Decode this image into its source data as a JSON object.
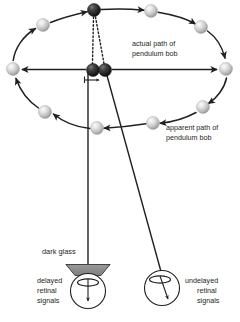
{
  "figure": {
    "background_color": "#ffffff",
    "line_color": "#231f20",
    "labels": {
      "actual_path_line1": "actual path of",
      "actual_path_line2": "pendulum bob",
      "apparent_path_line1": "apparent path of",
      "apparent_path_line2": "pendulum bob",
      "dark_glass": "dark glass",
      "delayed_line1": "delayed",
      "delayed_line2": "retinal",
      "delayed_line3": "signals",
      "undelayed_line1": "undelayed",
      "undelayed_line2": "retinal",
      "undelayed_line3": "signals"
    },
    "colors": {
      "stroke": "#231f20",
      "light_sphere_light": "#f2f2f2",
      "light_sphere_mid": "#c9c9c9",
      "light_sphere_dark": "#8c8c8c",
      "dark_sphere_light": "#6e6e6e",
      "dark_sphere_mid": "#2b2b2b",
      "dark_sphere_dark": "#111111",
      "glass_fill": "#8a8a8a",
      "glass_top_fill": "#b5b5b5"
    },
    "geometry": {
      "ellipse_center_x": 119,
      "ellipse_center_y": 69,
      "ellipse_radius_x": 107,
      "ellipse_radius_y": 59
    },
    "spheres": [
      {
        "name": "bob-top-actual",
        "cx": 94,
        "cy": 10,
        "r": 6.5,
        "shade": "dark"
      },
      {
        "name": "bob-upper-left",
        "cx": 43,
        "cy": 25,
        "r": 6.5,
        "shade": "light"
      },
      {
        "name": "bob-left",
        "cx": 13,
        "cy": 69,
        "r": 6.5,
        "shade": "light"
      },
      {
        "name": "bob-lower-left",
        "cx": 45,
        "cy": 112,
        "r": 6.5,
        "shade": "light"
      },
      {
        "name": "bob-bottom",
        "cx": 97,
        "cy": 128,
        "r": 6.5,
        "shade": "light"
      },
      {
        "name": "bob-lower-right",
        "cx": 153,
        "cy": 123,
        "r": 6.5,
        "shade": "light"
      },
      {
        "name": "bob-right-lower",
        "cx": 203,
        "cy": 107,
        "r": 6.5,
        "shade": "light"
      },
      {
        "name": "bob-right",
        "cx": 226,
        "cy": 69,
        "r": 6.5,
        "shade": "light"
      },
      {
        "name": "bob-upper-right",
        "cx": 201,
        "cy": 27,
        "r": 6.5,
        "shade": "light"
      },
      {
        "name": "bob-top-right",
        "cx": 151,
        "cy": 11,
        "r": 6.5,
        "shade": "light"
      },
      {
        "name": "bob-center-actual",
        "cx": 93,
        "cy": 70,
        "r": 6.5,
        "shade": "dark"
      },
      {
        "name": "bob-center-apparent",
        "cx": 105,
        "cy": 70,
        "r": 6.5,
        "shade": "dark"
      }
    ]
  }
}
